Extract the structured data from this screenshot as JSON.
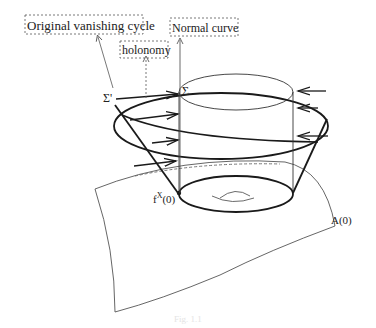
{
  "labels": {
    "original_vanishing_cycle": "Original vanishing cycle",
    "holonomy": "holonomy",
    "normal_curve": "Normal curve",
    "sigma_prime": "Σ'",
    "sigma": "Σ",
    "fx0": "f",
    "fx0_sup": "X",
    "fx0_arg": "(0)",
    "a0": "A(0)"
  },
  "caption": "Fig. 1.1",
  "colors": {
    "stroke": "#1a1a1a",
    "thin": "#444444",
    "dashed": "#666666"
  }
}
